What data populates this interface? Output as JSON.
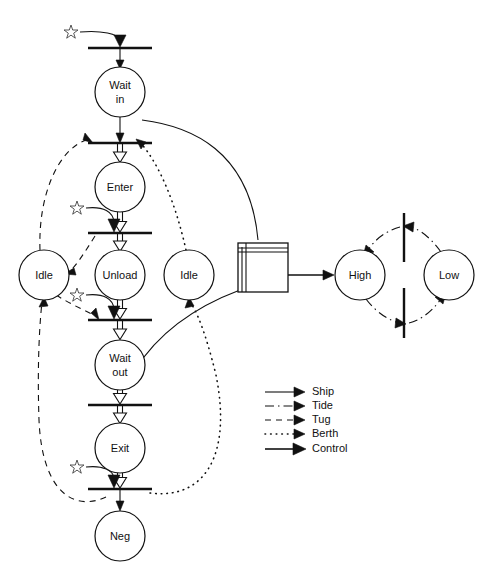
{
  "diagram": {
    "places": [
      {
        "id": "wait-in",
        "label": "Wait\nin",
        "line1": "Wait",
        "line2": "in",
        "cx": 120,
        "cy": 92,
        "r": 25
      },
      {
        "id": "enter",
        "label": "Enter",
        "line1": "Enter",
        "line2": "",
        "cx": 120,
        "cy": 187,
        "r": 25
      },
      {
        "id": "unload",
        "label": "Unload",
        "line1": "Unload",
        "line2": "",
        "cx": 120,
        "cy": 275,
        "r": 25
      },
      {
        "id": "wait-out",
        "label": "Wait\nout",
        "line1": "Wait",
        "line2": "out",
        "cx": 120,
        "cy": 365,
        "r": 25
      },
      {
        "id": "exit",
        "label": "Exit",
        "line1": "Exit",
        "line2": "",
        "cx": 120,
        "cy": 448,
        "r": 25
      },
      {
        "id": "neg",
        "label": "Neg",
        "line1": "Neg",
        "line2": "",
        "cx": 120,
        "cy": 536,
        "r": 25
      },
      {
        "id": "tug-idle",
        "label": "Idle",
        "line1": "Idle",
        "line2": "",
        "cx": 44,
        "cy": 275,
        "r": 25
      },
      {
        "id": "berth-idle",
        "label": "Idle",
        "line1": "Idle",
        "line2": "",
        "cx": 189,
        "cy": 275,
        "r": 25
      },
      {
        "id": "tide-high",
        "label": "High",
        "line1": "High",
        "line2": "",
        "cx": 360,
        "cy": 275,
        "r": 25
      },
      {
        "id": "tide-low",
        "label": "Low",
        "line1": "Low",
        "line2": "",
        "cx": 449,
        "cy": 275,
        "r": 25
      }
    ],
    "transitions": [
      {
        "id": "t-arrive",
        "x1": 88,
        "x2": 152,
        "y": 48
      },
      {
        "id": "t-enter",
        "x1": 88,
        "x2": 152,
        "y": 143
      },
      {
        "id": "t-unload",
        "x1": 88,
        "x2": 152,
        "y": 233
      },
      {
        "id": "t-depart",
        "x1": 88,
        "x2": 152,
        "y": 320
      },
      {
        "id": "t-exit",
        "x1": 88,
        "x2": 152,
        "y": 405
      },
      {
        "id": "t-release",
        "x1": 88,
        "x2": 152,
        "y": 489
      },
      {
        "id": "t-tide-up",
        "x": 404,
        "y1": 213,
        "y2": 262
      },
      {
        "id": "t-tide-down",
        "x": 404,
        "y1": 288,
        "y2": 338
      }
    ],
    "control_box": {
      "id": "controller",
      "x": 238,
      "y": 243,
      "w": 50,
      "h": 49
    },
    "legend": {
      "x": 265,
      "y": 392,
      "entries": [
        {
          "id": "ship",
          "label": "Ship",
          "style": "solid-thin"
        },
        {
          "id": "tide",
          "label": "Tide",
          "style": "dash-dot"
        },
        {
          "id": "tug",
          "label": "Tug",
          "style": "dashed"
        },
        {
          "id": "berth",
          "label": "Berth",
          "style": "dotted"
        },
        {
          "id": "control",
          "label": "Control",
          "style": "solid-thick"
        }
      ]
    },
    "colors": {
      "stroke": "#111111",
      "fill": "#ffffff",
      "star": "#444444"
    },
    "star_markers": [
      {
        "id": "star-arrive",
        "x": 71,
        "y": 31
      },
      {
        "id": "star-unload",
        "x": 77,
        "y": 207
      },
      {
        "id": "star-depart",
        "x": 77,
        "y": 294
      },
      {
        "id": "star-release",
        "x": 77,
        "y": 466
      }
    ]
  }
}
